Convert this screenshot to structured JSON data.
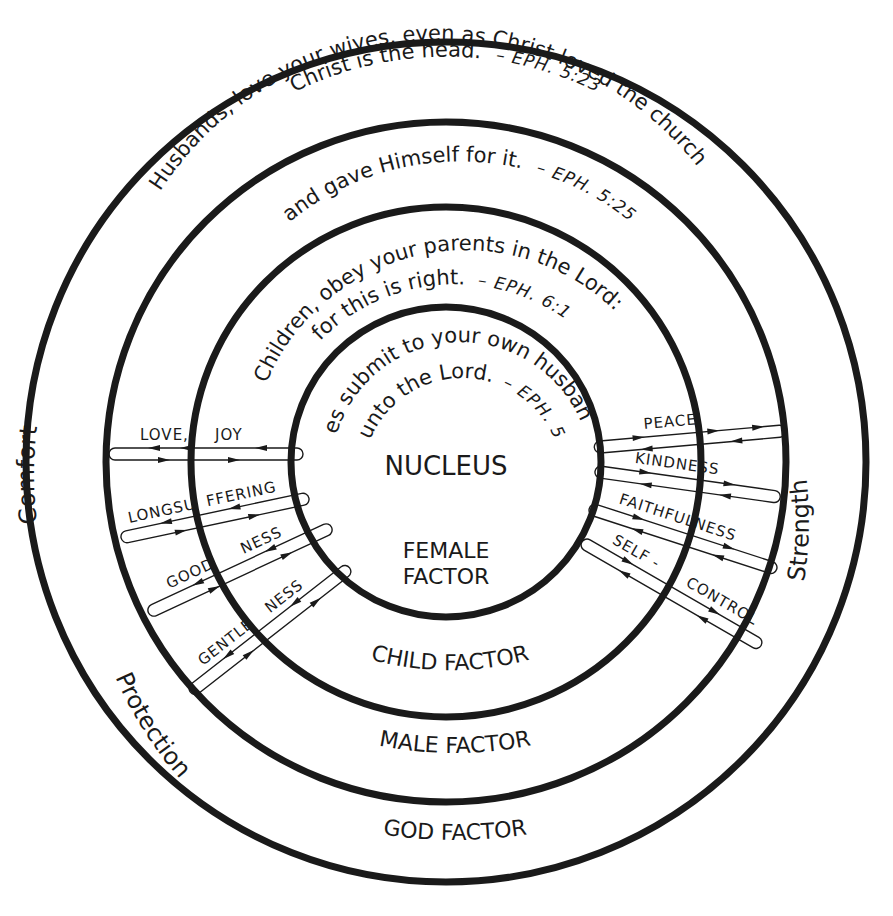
{
  "diagram": {
    "rings": [
      {
        "name": "god",
        "factor_label": "GOD FACTOR",
        "verse": "Christ is the head.",
        "reference": "– EPH. 5:23"
      },
      {
        "name": "male",
        "factor_label": "MALE FACTOR",
        "verse_line1": "Husbands, love your wives, even as Christ loved the church",
        "verse_line2": "and gave Himself for it.",
        "reference": "– EPH. 5:25"
      },
      {
        "name": "child",
        "factor_label": "CHILD FACTOR",
        "verse_line1": "Children, obey your parents in the Lord:",
        "verse_line2": "for this is right.",
        "reference": "– EPH. 6:1"
      },
      {
        "name": "female",
        "factor_label_line1": "FEMALE",
        "factor_label_line2": "FACTOR",
        "verse_line1": "Wives submit to your own husbands,",
        "verse_line2": "as unto the Lord.",
        "reference": "– EPH. 5:22"
      }
    ],
    "center_label": "NUCLEUS",
    "side_labels": {
      "left": "Comfort",
      "lower_left": "Protection",
      "right": "Strength"
    },
    "fruits_left": [
      {
        "part1": "LOVE,",
        "part2": "JOY"
      },
      {
        "part1": "LONGSU",
        "part2": "FFERING"
      },
      {
        "part1": "GOOD",
        "part2": "NESS"
      },
      {
        "part1": "GENTLE",
        "part2": "NESS"
      }
    ],
    "fruits_right": [
      {
        "part1": "PEACE",
        "part2": ""
      },
      {
        "part1": "KINDNESS",
        "part2": ""
      },
      {
        "part1": "FAITHFULNESS",
        "part2": ""
      },
      {
        "part1": "SELF -",
        "part2": "CONTROL"
      }
    ],
    "colors": {
      "ink": "#1a1a1a",
      "paper": "#ffffff"
    }
  }
}
